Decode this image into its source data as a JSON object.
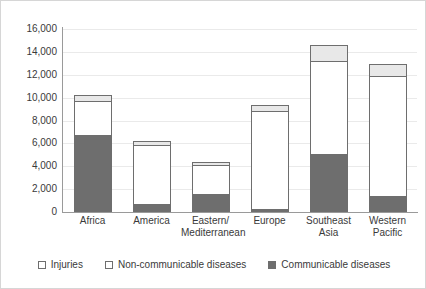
{
  "chart_data": {
    "type": "bar",
    "subtype": "stacked-vertical",
    "title": "",
    "xlabel": "",
    "ylabel": "",
    "ylim": [
      0,
      16000
    ],
    "ytick_step": 2000,
    "ytick_labels": [
      "16,000",
      "14,000",
      "12,000",
      "10,000",
      "8,000",
      "6,000",
      "4,000",
      "2,000",
      "0"
    ],
    "ytick_values": [
      16000,
      14000,
      12000,
      10000,
      8000,
      6000,
      4000,
      2000,
      0
    ],
    "grid": true,
    "grid_axis": "y",
    "legend_position": "bottom",
    "categories": [
      "Africa",
      "America",
      "Eastern/ Mediterranean",
      "Europe",
      "Southeast Asia",
      "Western Pacific"
    ],
    "category_lines": [
      [
        "Africa"
      ],
      [
        "America"
      ],
      [
        "Eastern/",
        "Mediterranean"
      ],
      [
        "Europe"
      ],
      [
        "Southeast",
        "Asia"
      ],
      [
        "Western",
        "Pacific"
      ]
    ],
    "series": [
      {
        "name": "Communicable diseases",
        "color": "#6e6e6e",
        "values": [
          6700,
          700,
          1600,
          300,
          5100,
          1400
        ]
      },
      {
        "name": "Non-communicable diseases",
        "color": "#ffffff",
        "values": [
          3000,
          5200,
          2500,
          8500,
          8100,
          10500
        ]
      },
      {
        "name": "Injuries",
        "color": "#e8e8e8",
        "values": [
          500,
          300,
          300,
          600,
          1400,
          1000
        ]
      }
    ],
    "totals": [
      10200,
      6200,
      4400,
      9400,
      14600,
      12900
    ]
  },
  "legend": {
    "items": [
      {
        "label": "Injuries",
        "swatch": "injuries"
      },
      {
        "label": "Non-communicable diseases",
        "swatch": "noncommunicable"
      },
      {
        "label": "Communicable diseases",
        "swatch": "communicable"
      }
    ]
  }
}
